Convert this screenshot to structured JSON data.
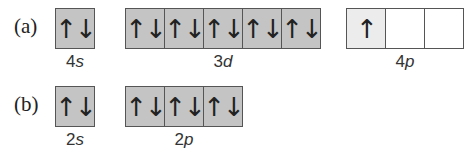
{
  "rows": [
    {
      "label": "(a)",
      "subshells": [
        {
          "name": "4s",
          "num": "4",
          "letter": "s",
          "orbitals": [
            "↑↓"
          ],
          "fill": [
            "filled"
          ]
        },
        {
          "name": "3d",
          "num": "3",
          "letter": "d",
          "orbitals": [
            "↑↓",
            "↑↓",
            "↑↓",
            "↑↓",
            "↑↓"
          ],
          "fill": [
            "filled",
            "filled",
            "filled",
            "filled",
            "filled"
          ]
        },
        {
          "name": "4p",
          "num": "4",
          "letter": "p",
          "orbitals": [
            "↑",
            "",
            ""
          ],
          "fill": [
            "half",
            "empty",
            "empty"
          ]
        }
      ]
    },
    {
      "label": "(b)",
      "subshells": [
        {
          "name": "2s",
          "num": "2",
          "letter": "s",
          "orbitals": [
            "↑↓"
          ],
          "fill": [
            "filled"
          ]
        },
        {
          "name": "2p",
          "num": "2",
          "letter": "p",
          "orbitals": [
            "↑↓",
            "↑↓",
            "↑↓"
          ],
          "fill": [
            "filled",
            "filled",
            "filled"
          ]
        }
      ]
    }
  ],
  "colors": {
    "filled": "#c4c4c4",
    "half": "#ececec",
    "empty": "#ffffff",
    "border": "#555555"
  }
}
